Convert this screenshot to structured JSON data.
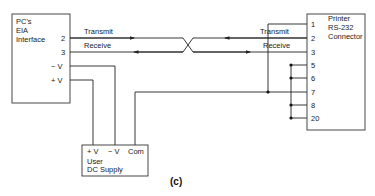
{
  "pc_box": {
    "title_lines": [
      "PC's",
      "EIA",
      "Interface"
    ],
    "pins": [
      "2",
      "3",
      "− V",
      "+ V"
    ]
  },
  "printer_box": {
    "title_lines": [
      "Printer",
      "RS-232",
      "Connector"
    ],
    "pins": [
      "1",
      "2",
      "3",
      "5",
      "6",
      "7",
      "8",
      "20"
    ]
  },
  "signals": {
    "left": [
      "Transmit",
      "Receive"
    ],
    "right": [
      "Transmit",
      "Receive"
    ]
  },
  "supply_box": {
    "terminals": [
      "+ V",
      "− V",
      "Com"
    ],
    "title_lines": [
      "User",
      "DC Supply"
    ]
  },
  "caption": "(c)"
}
